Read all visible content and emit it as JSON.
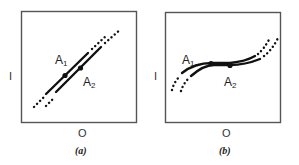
{
  "panels": [
    {
      "id": "a",
      "caption": "(a)",
      "y_axis_label": "I",
      "x_axis_label": "O",
      "point_labels": {
        "first": {
          "letter": "A",
          "subscript": "1"
        },
        "second": {
          "letter": "A",
          "subscript": "2"
        }
      },
      "description": "Two parallel straight lines with positive slope, each with a dot on it; dotted extensions at both ends"
    },
    {
      "id": "b",
      "caption": "(b)",
      "y_axis_label": "I",
      "x_axis_label": "O",
      "point_labels": {
        "first": {
          "letter": "A",
          "subscript": "1"
        },
        "second": {
          "letter": "A",
          "subscript": "2"
        }
      },
      "description": "Two parallel S-shaped curves, flat in the middle where points A1 and A2 lie; dotted extensions at both ends"
    }
  ],
  "colors": {
    "ink": "#111111",
    "frame": "#555555",
    "background": "#ffffff"
  }
}
